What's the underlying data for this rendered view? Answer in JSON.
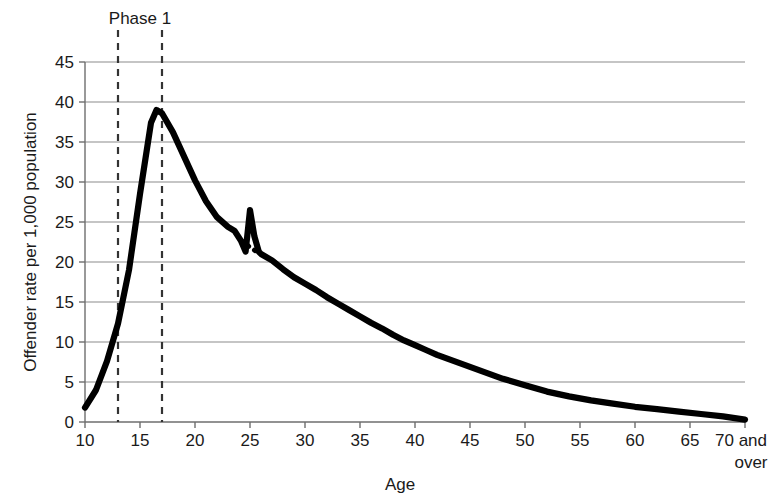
{
  "chart_data": {
    "type": "line",
    "title": "",
    "xlabel": "Age",
    "ylabel": "Offender rate per 1,000 population",
    "xlim": [
      10,
      70
    ],
    "ylim": [
      0,
      45
    ],
    "grid": true,
    "legend": null,
    "x_tick_labels": [
      "10",
      "15",
      "20",
      "25",
      "30",
      "35",
      "40",
      "45",
      "50",
      "55",
      "60",
      "65",
      "70 and"
    ],
    "x_tick_values": [
      10,
      15,
      20,
      25,
      30,
      35,
      40,
      45,
      50,
      55,
      60,
      65,
      70
    ],
    "x_last_tick_second_line": "over",
    "y_tick_labels": [
      "0",
      "5",
      "10",
      "15",
      "20",
      "25",
      "30",
      "35",
      "40",
      "45"
    ],
    "y_tick_values": [
      0,
      5,
      10,
      15,
      20,
      25,
      30,
      35,
      40,
      45
    ],
    "line_color": "#000000",
    "grid_color": "#8c8c8c",
    "axis_color": "#6e6e6e",
    "x": [
      10,
      11,
      12,
      13,
      14,
      15,
      16,
      16.5,
      17,
      18,
      19,
      20,
      21,
      22,
      23,
      23.6,
      24.2,
      24.6,
      25,
      25.4,
      25.8,
      26,
      27,
      28,
      29,
      30,
      31,
      32,
      33,
      34,
      35,
      36,
      37,
      38,
      39,
      40,
      41,
      42,
      43,
      44,
      45,
      46,
      47,
      48,
      49,
      50,
      52,
      54,
      56,
      58,
      60,
      62,
      64,
      66,
      68,
      70
    ],
    "values": [
      1.8,
      4.0,
      7.6,
      12.3,
      19.0,
      28.5,
      37.4,
      39.0,
      38.6,
      36.2,
      33.2,
      30.2,
      27.6,
      25.6,
      24.4,
      23.9,
      22.6,
      21.3,
      26.5,
      23.2,
      21.3,
      21.0,
      20.2,
      19.1,
      18.1,
      17.3,
      16.5,
      15.6,
      14.8,
      14.0,
      13.2,
      12.4,
      11.7,
      10.9,
      10.2,
      9.6,
      9.0,
      8.4,
      7.9,
      7.4,
      6.9,
      6.4,
      5.9,
      5.4,
      5.0,
      4.6,
      3.8,
      3.2,
      2.7,
      2.3,
      1.9,
      1.6,
      1.3,
      1.0,
      0.7,
      0.3
    ],
    "notch_dotted_segment": {
      "x": [
        24.2,
        25.6
      ],
      "values": [
        22.6,
        21.3
      ],
      "style": "dotted"
    },
    "annotations": [
      {
        "name": "phase-1",
        "label": "Phase 1",
        "type": "vertical-span",
        "x_start": 13,
        "x_end": 17,
        "line_style": "dashed"
      }
    ]
  }
}
